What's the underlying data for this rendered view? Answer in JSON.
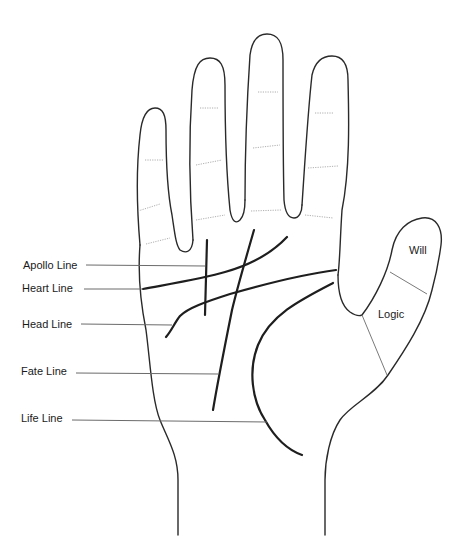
{
  "diagram": {
    "line_labels": [
      {
        "id": "apollo",
        "label": "Apollo Line"
      },
      {
        "id": "heart",
        "label": "Heart Line"
      },
      {
        "id": "head",
        "label": "Head Line"
      },
      {
        "id": "fate",
        "label": "Fate Line"
      },
      {
        "id": "life",
        "label": "Life Line"
      }
    ],
    "thumb_zones": [
      {
        "id": "will",
        "label": "Will"
      },
      {
        "id": "logic",
        "label": "Logic"
      }
    ],
    "colors": {
      "background": "#ffffff",
      "outline": "#2a2a2a",
      "palm_lines": "#1e1e1e",
      "leaders": "#6b6b6b"
    }
  }
}
